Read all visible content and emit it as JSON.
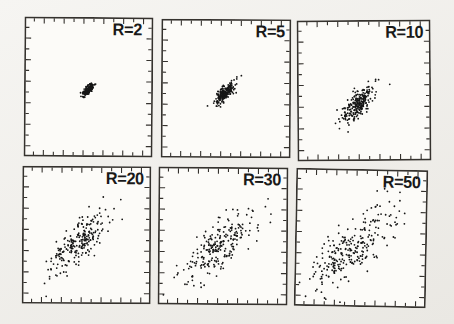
{
  "figure": {
    "background_top": "#f6f5f2",
    "background_bottom": "#eae8e3",
    "panel_fill": "#fcfbf8",
    "line_color": "#35322e",
    "point_color": "#161616",
    "label_color": "#191919"
  },
  "chart_data": {
    "type": "scatter",
    "title": "",
    "layout": {
      "grid": "2 rows x 3 columns of square scatter panels",
      "legend": "none",
      "axis_tick_labels": "none",
      "ticks": "short unlabeled tick marks pointing inward on all four sides, about 12 per side",
      "frame": "thin dark rectangular border around each panel"
    },
    "note": "Same positively correlated bivariate cloud at increasing spread R; clouds elongated along the +45 degree diagonal. center_x/center_y are panel fractions (y measured downward); sigmas are fractions of panel size along the diagonal major/minor axes.",
    "panels": [
      {
        "label": "R=2",
        "n_points": 170,
        "center_x": 0.5,
        "center_y": 0.52,
        "sigma_major": 0.031,
        "sigma_minor": 0.012,
        "angle_deg": 45,
        "seed": 101
      },
      {
        "label": "R=5",
        "n_points": 220,
        "center_x": 0.49,
        "center_y": 0.53,
        "sigma_major": 0.054,
        "sigma_minor": 0.02,
        "angle_deg": 45,
        "seed": 102
      },
      {
        "label": "R=10",
        "n_points": 250,
        "center_x": 0.455,
        "center_y": 0.595,
        "sigma_major": 0.082,
        "sigma_minor": 0.032,
        "angle_deg": 45,
        "seed": 103
      },
      {
        "label": "R=20",
        "n_points": 235,
        "center_x": 0.435,
        "center_y": 0.555,
        "sigma_major": 0.148,
        "sigma_minor": 0.055,
        "angle_deg": 45,
        "seed": 104
      },
      {
        "label": "R=30",
        "n_points": 240,
        "center_x": 0.475,
        "center_y": 0.575,
        "sigma_major": 0.185,
        "sigma_minor": 0.068,
        "angle_deg": 45,
        "seed": 105
      },
      {
        "label": "R=50",
        "n_points": 265,
        "center_x": 0.43,
        "center_y": 0.595,
        "sigma_major": 0.23,
        "sigma_minor": 0.082,
        "angle_deg": 45,
        "seed": 106
      }
    ]
  }
}
